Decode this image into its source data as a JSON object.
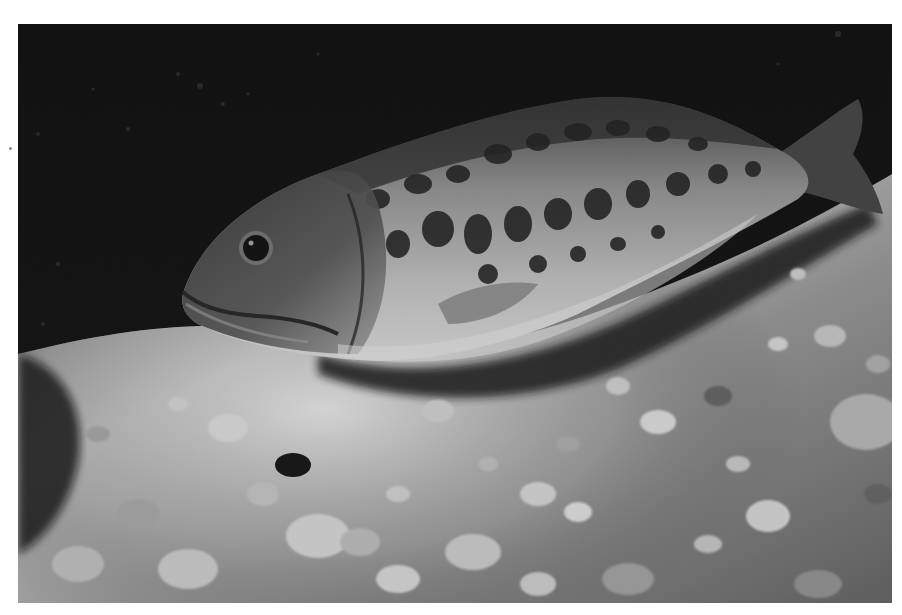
{
  "photo": {
    "subject": "largemouth-bass",
    "description": "Black and white underwater photograph of a bass resting above a pebbly, sunlit lake bottom",
    "frame": {
      "left": 18,
      "top": 24,
      "width": 874,
      "height": 579
    },
    "colors": {
      "margin": "#ffffff",
      "background_dark": "#050505",
      "fish_body_light": "#cfcfcf",
      "fish_body_mid": "#7a7a7a",
      "fish_spots": "#1a1a1a",
      "substrate_light": "#d8d8d8",
      "substrate_mid": "#8c8c8c",
      "shadow": "#151515"
    }
  },
  "margin_mark": {
    "x": 10,
    "y": 148,
    "color": "#8a8a8a"
  }
}
